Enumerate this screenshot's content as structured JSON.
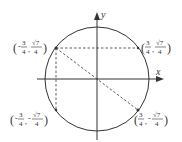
{
  "diagram": {
    "axes": {
      "x_label": "x",
      "y_label": "y"
    },
    "circle": {
      "cx": 97,
      "cy": 79,
      "r": 52,
      "color": "#333333"
    },
    "points": [
      {
        "name": "upper-left",
        "label_sign_x": "-",
        "label_sign_y": "",
        "x_num": "3",
        "x_den": "4",
        "y_num": "√7",
        "y_den": "4",
        "px": 56,
        "py": 48
      },
      {
        "name": "upper-right",
        "label_sign_x": "",
        "label_sign_y": "",
        "x_num": "3",
        "x_den": "4",
        "y_num": "√7",
        "y_den": "4",
        "px": 138,
        "py": 48
      },
      {
        "name": "lower-left",
        "label_sign_x": "-",
        "label_sign_y": "-",
        "x_num": "3",
        "x_den": "4",
        "y_num": "√7",
        "y_den": "4",
        "px": 56,
        "py": 110
      },
      {
        "name": "lower-right",
        "label_sign_x": "",
        "label_sign_y": "-",
        "x_num": "3",
        "x_den": "4",
        "y_num": "√7",
        "y_den": "4",
        "px": 138,
        "py": 110
      }
    ],
    "labels": {
      "ul": {
        "open": "(",
        "sx": "-",
        "xn": "3",
        "xd": "4",
        "comma": ",",
        "sy": "",
        "yn": "√7",
        "yd": "4",
        "close": ")"
      },
      "ur": {
        "open": "(",
        "sx": "",
        "xn": "3",
        "xd": "4",
        "comma": ",",
        "sy": "",
        "yn": "√7",
        "yd": "4",
        "close": ")"
      },
      "ll": {
        "open": "(",
        "sx": "-",
        "xn": "3",
        "xd": "4",
        "comma": ",",
        "sy": "-",
        "yn": "√7",
        "yd": "4",
        "close": ")"
      },
      "lr": {
        "open": "(",
        "sx": "",
        "xn": "3",
        "xd": "4",
        "comma": ",",
        "sy": "-",
        "yn": "√7",
        "yd": "4",
        "close": ")"
      }
    }
  }
}
